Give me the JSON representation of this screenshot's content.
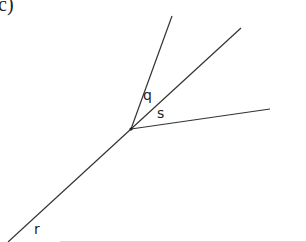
{
  "diagram": {
    "part_label": "c)",
    "vertex": {
      "x": 131,
      "y": 129
    },
    "rays": [
      {
        "id": "ray-top-steep",
        "x2": 172,
        "y2": 16
      },
      {
        "id": "ray-top-diagonal",
        "x2": 241,
        "y2": 28
      },
      {
        "id": "ray-right",
        "x2": 270,
        "y2": 109
      },
      {
        "id": "ray-lower-left",
        "x2": 8,
        "y2": 242
      }
    ],
    "angle_labels": [
      {
        "text": "q",
        "x": 143,
        "y": 88
      },
      {
        "text": "s",
        "x": 157,
        "y": 106
      },
      {
        "text": "r",
        "x": 34,
        "y": 222
      }
    ],
    "colors": {
      "line": "#333333",
      "text": "#222222",
      "border": "#d8d8d8"
    }
  }
}
